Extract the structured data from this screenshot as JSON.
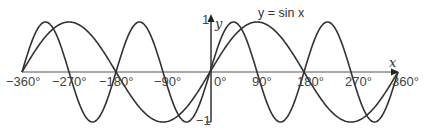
{
  "chart_data": {
    "type": "line",
    "title": "",
    "xlabel": "x",
    "ylabel": "y",
    "xlim": [
      -360,
      360
    ],
    "ylim": [
      -1,
      1
    ],
    "grid": false,
    "x_ticks": [
      "−360°",
      "−270°",
      "−180°",
      "−90°",
      "0°",
      "90°",
      "180°",
      "270°",
      "360°"
    ],
    "y_ticks": [
      "1",
      "−1"
    ],
    "series": [
      {
        "name": "y = sin x",
        "function": "sin(x)",
        "x": [
          -360,
          -270,
          -180,
          -90,
          0,
          90,
          180,
          270,
          360
        ],
        "values": [
          0,
          1,
          0,
          -1,
          0,
          1,
          0,
          -1,
          0
        ]
      },
      {
        "name": "y = sin 2x",
        "function": "sin(2x)",
        "x": [
          -360,
          -315,
          -270,
          -225,
          -180,
          -135,
          -90,
          -45,
          0,
          45,
          90,
          135,
          180,
          225,
          270,
          315,
          360
        ],
        "values": [
          0,
          1,
          0,
          -1,
          0,
          1,
          0,
          -1,
          0,
          1,
          0,
          -1,
          0,
          1,
          0,
          -1,
          0
        ]
      }
    ],
    "annotations": [
      "y = sin x"
    ]
  },
  "labels": {
    "x_axis": "x",
    "y_axis": "y",
    "y_top": "1",
    "y_bottom": "−1",
    "curve_label": "y = sin x",
    "ticks": [
      "−360°",
      "−270°",
      "−180°",
      "−90°",
      "0°",
      "90°",
      "180°",
      "270°",
      "360°"
    ]
  }
}
